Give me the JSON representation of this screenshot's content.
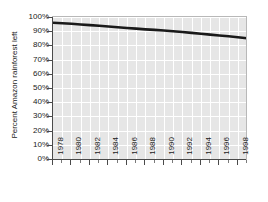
{
  "chart_data": {
    "type": "line",
    "title": "",
    "xlabel": "",
    "ylabel": "Percent Amazon rainforest left",
    "x": [
      1978,
      1979,
      1980,
      1981,
      1982,
      1983,
      1984,
      1985,
      1986,
      1987,
      1988,
      1989,
      1990,
      1991,
      1992,
      1993,
      1994,
      1995,
      1996,
      1997,
      1998,
      1999
    ],
    "values": [
      96.0,
      95.6,
      95.2,
      94.7,
      94.3,
      93.8,
      93.3,
      92.8,
      92.3,
      91.8,
      91.3,
      90.9,
      90.5,
      90.0,
      89.4,
      88.8,
      88.2,
      87.6,
      87.0,
      86.4,
      85.7,
      85.0
    ],
    "series": [
      {
        "name": "Percent Amazon rainforest left",
        "values": [
          96.0,
          95.6,
          95.2,
          94.7,
          94.3,
          93.8,
          93.3,
          92.8,
          92.3,
          91.8,
          91.3,
          90.9,
          90.5,
          90.0,
          89.4,
          88.8,
          88.2,
          87.6,
          87.0,
          86.4,
          85.7,
          85.0
        ],
        "color": "#1a1a1a"
      }
    ],
    "xlim": [
      1978,
      1999
    ],
    "ylim": [
      0,
      100
    ],
    "y_ticks": [
      0,
      10,
      20,
      30,
      40,
      50,
      60,
      70,
      80,
      90,
      100
    ],
    "y_tick_labels": [
      "0%",
      "10%",
      "20%",
      "30%",
      "40%",
      "50%",
      "60%",
      "70%",
      "80%",
      "90%",
      "100%"
    ],
    "x_ticks": [
      1978,
      1980,
      1982,
      1984,
      1986,
      1988,
      1990,
      1992,
      1994,
      1996,
      1998
    ],
    "x_tick_labels": [
      "1978",
      "1980",
      "1982",
      "1984",
      "1986",
      "1988",
      "1990",
      "1992",
      "1994",
      "1996",
      "1998"
    ],
    "x_minor_ticks": [
      1979,
      1981,
      1983,
      1985,
      1987,
      1989,
      1991,
      1993,
      1995,
      1997,
      1999
    ],
    "grid": true,
    "grid_color": "#ffffff",
    "plot_background": "#e6e6e6",
    "figure_background": "#ffffff",
    "axis_color": "#4a4a4a",
    "legend": null,
    "legend_position": "none"
  }
}
